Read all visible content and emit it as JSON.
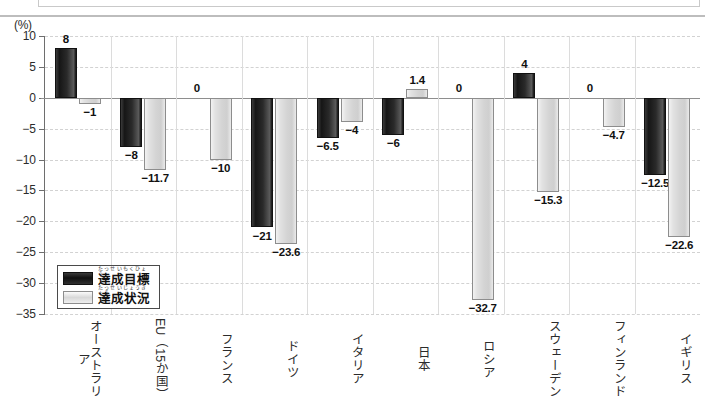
{
  "unit_label": "(%)",
  "legend": {
    "items": [
      {
        "key": "target",
        "label": "達成目標",
        "ruby": "たっせいもくひょう",
        "color": "#161616"
      },
      {
        "key": "status",
        "label": "達成状況",
        "ruby": "たっせいじょうきょう",
        "color": "#d8d8d8"
      }
    ]
  },
  "yaxis": {
    "ticks": [
      "10",
      "5",
      "0",
      "-5",
      "-10",
      "-15",
      "-20",
      "-25",
      "-30",
      "-35"
    ],
    "min": -35,
    "max": 10,
    "step": 5
  },
  "chart_data": {
    "type": "bar",
    "title": "",
    "subtitle": "",
    "xlabel": "",
    "ylabel": "(%)",
    "ylim": [
      -35,
      10
    ],
    "ytick_step": 5,
    "grid": true,
    "legend_position": "inside-bottom-left",
    "categories": [
      "オーストラリア",
      "EU（15か国）",
      "フランス",
      "ドイツ",
      "イタリア",
      "日本",
      "ロシア",
      "スウェーデン",
      "フィンランド",
      "イギリス"
    ],
    "category_labels_display": [
      {
        "main": "オーストラリア",
        "ruby": ""
      },
      {
        "main": "EU（15か国）",
        "ruby": "イーユー"
      },
      {
        "main": "フランス",
        "ruby": ""
      },
      {
        "main": "ドイツ",
        "ruby": ""
      },
      {
        "main": "イタリア",
        "ruby": ""
      },
      {
        "main": "日本",
        "ruby": "にほん"
      },
      {
        "main": "ロシア",
        "ruby": ""
      },
      {
        "main": "スウェーデン",
        "ruby": ""
      },
      {
        "main": "フィンランド",
        "ruby": ""
      },
      {
        "main": "イギリス",
        "ruby": ""
      }
    ],
    "series": [
      {
        "name": "達成目標",
        "color": "#161616",
        "values": [
          8,
          -8,
          0,
          -21,
          -6.5,
          -6,
          0,
          4,
          0,
          -12.5
        ],
        "value_labels": [
          "8",
          "-8",
          "0",
          "-21",
          "-6.5",
          "-6",
          "0",
          "4",
          "0",
          "-12.5"
        ]
      },
      {
        "name": "達成状況",
        "color": "#d8d8d8",
        "values": [
          -1,
          -11.7,
          -10,
          -23.6,
          -4,
          1.4,
          -32.7,
          -15.3,
          -4.7,
          -22.6
        ],
        "value_labels": [
          "-1",
          "-11.7",
          "-10",
          "-23.6",
          "-4",
          "1.4",
          "-32.7",
          "-15.3",
          "-4.7",
          "-22.6"
        ]
      }
    ]
  }
}
